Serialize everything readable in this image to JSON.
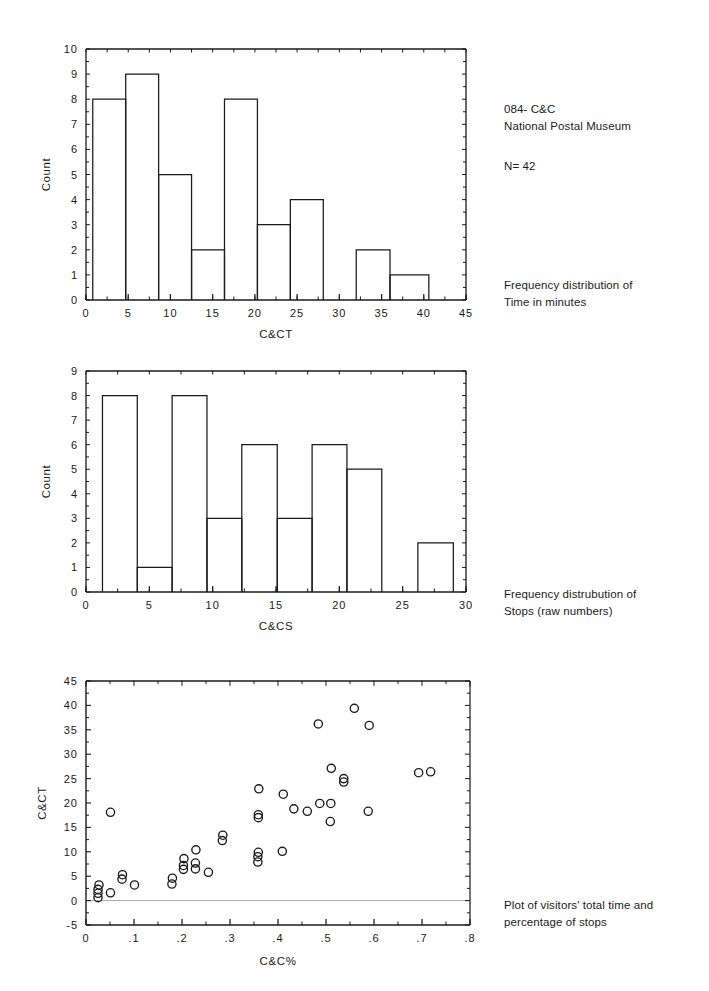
{
  "document": {
    "header_lines": "084- C&C\nNational Postal Museum",
    "n_label": "N= 42",
    "caption_1": "Frequency distribution of\nTime in minutes",
    "caption_2": "Frequency distrubution of\nStops (raw numbers)",
    "caption_3": "Plot of visitors' total time and\npercentage of stops"
  },
  "chart_data": [
    {
      "type": "bar",
      "name": "histogram-time",
      "title": "",
      "xlabel": "C&CT",
      "ylabel": "Count",
      "xlim": [
        0,
        45
      ],
      "ylim": [
        0,
        10
      ],
      "xticks": [
        0,
        5,
        10,
        15,
        20,
        25,
        30,
        35,
        40,
        45
      ],
      "yticks": [
        0,
        1,
        2,
        3,
        4,
        5,
        6,
        7,
        8,
        9,
        10
      ],
      "xtick_labels": [
        "0",
        "5",
        "10",
        "15",
        "20",
        "25",
        "30",
        "35",
        "40",
        "45"
      ],
      "ytick_labels": [
        "0",
        "1",
        "2",
        "3",
        "4",
        "5",
        "6",
        "7",
        "8",
        "9",
        "10"
      ],
      "grid": false,
      "legend": "none",
      "bin_edges": [
        0.8,
        4.7,
        8.6,
        12.5,
        16.4,
        20.3,
        24.2,
        28.1,
        32.0,
        36.0,
        40.6
      ],
      "values": [
        8,
        9,
        5,
        2,
        8,
        3,
        4,
        0,
        2,
        1
      ],
      "categories": [
        "0.8-4.7",
        "4.7-8.6",
        "8.6-12.5",
        "12.5-16.4",
        "16.4-20.3",
        "20.3-24.2",
        "24.2-28.1",
        "28.1-32.0",
        "32.0-36.0",
        "36.0-40.6"
      ]
    },
    {
      "type": "bar",
      "name": "histogram-stops",
      "title": "",
      "xlabel": "C&CS",
      "ylabel": "Count",
      "xlim": [
        0,
        30
      ],
      "ylim": [
        0,
        9
      ],
      "xticks": [
        0,
        5,
        10,
        15,
        20,
        25,
        30
      ],
      "yticks": [
        0,
        1,
        2,
        3,
        4,
        5,
        6,
        7,
        8,
        9
      ],
      "xtick_labels": [
        "0",
        "5",
        "10",
        "15",
        "20",
        "25",
        "30"
      ],
      "ytick_labels": [
        "0",
        "1",
        "2",
        "3",
        "4",
        "5",
        "6",
        "7",
        "8",
        "9"
      ],
      "grid": false,
      "legend": "none",
      "bin_edges": [
        1.3,
        4.05,
        6.8,
        9.55,
        12.3,
        15.1,
        17.85,
        20.6,
        23.35,
        26.2,
        29.0
      ],
      "values": [
        8,
        1,
        8,
        3,
        6,
        3,
        6,
        5,
        0,
        2
      ],
      "categories": [
        "1.3-4.1",
        "4.1-6.8",
        "6.8-9.6",
        "9.6-12.3",
        "12.3-15.1",
        "15.1-17.9",
        "17.9-20.6",
        "20.6-23.4",
        "23.4-26.2",
        "26.2-29.0"
      ]
    },
    {
      "type": "scatter",
      "name": "scatter-time-vs-percent-stops",
      "title": "",
      "xlabel": "C&C%",
      "ylabel": "C&CT",
      "xlim": [
        0,
        0.8
      ],
      "ylim": [
        -5,
        45
      ],
      "xticks": [
        0,
        0.1,
        0.2,
        0.3,
        0.4,
        0.5,
        0.6,
        0.7,
        0.8
      ],
      "yticks": [
        -5,
        0,
        5,
        10,
        15,
        20,
        25,
        30,
        35,
        40,
        45
      ],
      "xtick_labels": [
        "0",
        ".1",
        ".2",
        ".3",
        ".4",
        ".5",
        ".6",
        ".7",
        ".8"
      ],
      "ytick_labels": [
        "-5",
        "0",
        "5",
        "10",
        "15",
        "20",
        "25",
        "30",
        "35",
        "40",
        "45"
      ],
      "grid": false,
      "legend": "none",
      "marker": "open-circle",
      "zero_line": 0,
      "points": [
        [
          0.025,
          0.6
        ],
        [
          0.025,
          1.5
        ],
        [
          0.025,
          2.3
        ],
        [
          0.027,
          3.2
        ],
        [
          0.051,
          1.6
        ],
        [
          0.051,
          18.1
        ],
        [
          0.075,
          4.4
        ],
        [
          0.076,
          5.3
        ],
        [
          0.101,
          3.2
        ],
        [
          0.179,
          3.4
        ],
        [
          0.18,
          4.6
        ],
        [
          0.203,
          6.4
        ],
        [
          0.203,
          7.2
        ],
        [
          0.204,
          8.6
        ],
        [
          0.228,
          6.5
        ],
        [
          0.228,
          7.7
        ],
        [
          0.229,
          10.4
        ],
        [
          0.255,
          5.8
        ],
        [
          0.284,
          12.3
        ],
        [
          0.285,
          13.4
        ],
        [
          0.358,
          7.9
        ],
        [
          0.358,
          9.0
        ],
        [
          0.359,
          9.9
        ],
        [
          0.359,
          17.0
        ],
        [
          0.359,
          17.6
        ],
        [
          0.36,
          22.9
        ],
        [
          0.409,
          10.1
        ],
        [
          0.411,
          21.8
        ],
        [
          0.433,
          18.8
        ],
        [
          0.461,
          18.3
        ],
        [
          0.484,
          36.2
        ],
        [
          0.487,
          19.9
        ],
        [
          0.509,
          16.2
        ],
        [
          0.51,
          19.9
        ],
        [
          0.511,
          27.1
        ],
        [
          0.537,
          24.3
        ],
        [
          0.537,
          25.0
        ],
        [
          0.559,
          39.4
        ],
        [
          0.588,
          18.3
        ],
        [
          0.59,
          35.9
        ],
        [
          0.693,
          26.2
        ],
        [
          0.718,
          26.4
        ]
      ]
    }
  ]
}
